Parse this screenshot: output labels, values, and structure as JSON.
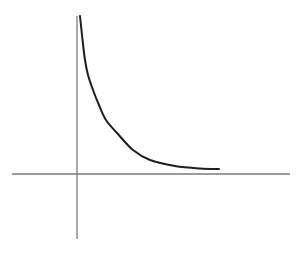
{
  "chart_data": {
    "type": "line",
    "title": "",
    "xlabel": "",
    "ylabel": "",
    "grid": false,
    "legend": null,
    "axes": {
      "x_axis": {
        "from_px": [
          12,
          174
        ],
        "to_px": [
          290,
          174
        ]
      },
      "y_axis": {
        "from_px": [
          77,
          16
        ],
        "to_px": [
          77,
          239
        ]
      },
      "origin_px": [
        77,
        174
      ]
    },
    "series": [
      {
        "name": "decaying curve (hyperbola-like, asymptotic to both axes)",
        "shape": "y = k/x",
        "points_px": [
          [
            80,
            16
          ],
          [
            82,
            35
          ],
          [
            85,
            60
          ],
          [
            88,
            75
          ],
          [
            93,
            90
          ],
          [
            99,
            105
          ],
          [
            106,
            120
          ],
          [
            117,
            133
          ],
          [
            133,
            150
          ],
          [
            150,
            160
          ],
          [
            175,
            166
          ],
          [
            200,
            168.5
          ],
          [
            219,
            169
          ]
        ]
      }
    ],
    "ticks": {
      "x": [],
      "y": []
    },
    "annotations": []
  },
  "style": {
    "axis_color": "#7a7a7a",
    "curve_color": "#1e1e1e",
    "background": "#ffffff"
  }
}
